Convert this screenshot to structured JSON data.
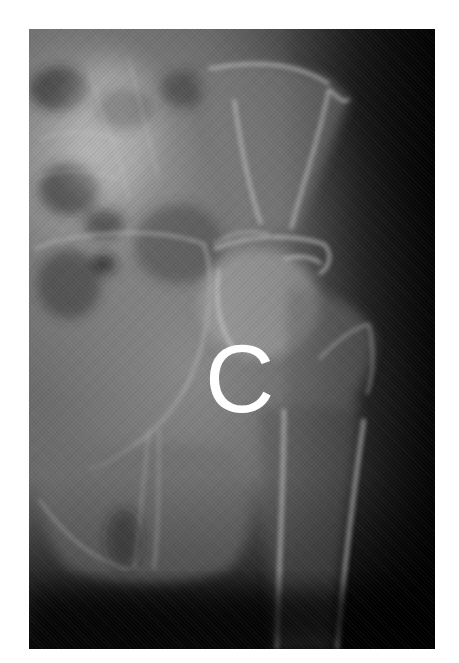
{
  "figure": {
    "type": "radiograph",
    "view": "pelvis / hip AP",
    "background_color": "#ffffff",
    "frame": {
      "x": 29,
      "y": 29,
      "width": 406,
      "height": 620
    },
    "colors": {
      "bone_highlight": "#d8d8d8",
      "soft_tissue": "#6e6e6e",
      "background_dark": "#0c0c0c",
      "label": "#ffffff"
    }
  },
  "label": {
    "text": "C"
  }
}
